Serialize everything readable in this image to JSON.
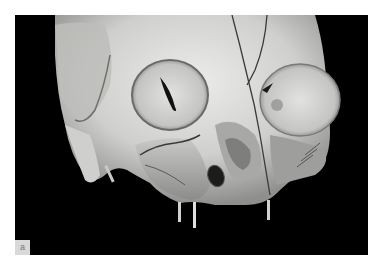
{
  "figure": {
    "panel_label": "a",
    "colors": {
      "background": "#000000",
      "bone": "#d8d8d6",
      "bone_shadow": "#8a8a88",
      "page": "#ffffff",
      "label_box": "#d9d9d9"
    }
  }
}
